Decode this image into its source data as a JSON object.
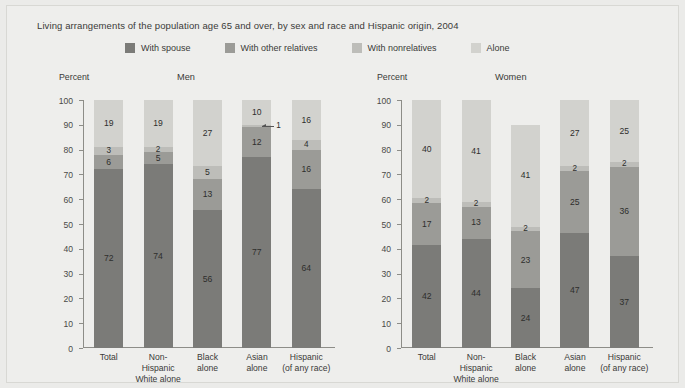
{
  "chart_data": {
    "type": "bar",
    "title": "Living arrangements of the population age 65 and over, by sex and race and Hispanic origin, 2004",
    "subtype": "stacked-bar",
    "ylabel": "Percent",
    "xlabel": "",
    "ylim": [
      0,
      100
    ],
    "ytick_labels": [
      "100",
      "90",
      "80",
      "70",
      "60",
      "50",
      "40",
      "30",
      "20",
      "10",
      "0"
    ],
    "ytick_values": [
      100,
      90,
      80,
      70,
      60,
      50,
      40,
      30,
      20,
      10,
      0
    ],
    "grid": false,
    "legend_position": "top",
    "legend": [
      {
        "label": "With spouse",
        "color": "#7b7b78"
      },
      {
        "label": "With other relatives",
        "color": "#9b9b97"
      },
      {
        "label": "With nonrelatives",
        "color": "#bdbdb9"
      },
      {
        "label": "Alone",
        "color": "#d2d2ce"
      }
    ],
    "series": [
      {
        "name": "With spouse",
        "color": "#7b7b78"
      },
      {
        "name": "With other relatives",
        "color": "#9b9b97"
      },
      {
        "name": "With nonrelatives",
        "color": "#bdbdb9"
      },
      {
        "name": "Alone",
        "color": "#d2d2ce"
      }
    ],
    "categories": [
      "Total",
      "Non-Hispanic White alone",
      "Black alone",
      "Asian alone",
      "Hispanic (of any race)"
    ],
    "panels": [
      {
        "name": "Men",
        "values": {
          "With spouse": [
            72,
            74,
            56,
            77,
            64
          ],
          "With other relatives": [
            6,
            5,
            13,
            12,
            16
          ],
          "With nonrelatives": [
            3,
            2,
            5,
            1,
            4
          ],
          "Alone": [
            19,
            19,
            27,
            10,
            16
          ]
        }
      },
      {
        "name": "Women",
        "values": {
          "With spouse": [
            42,
            44,
            24,
            47,
            37
          ],
          "With other relatives": [
            17,
            13,
            23,
            25,
            36
          ],
          "With nonrelatives": [
            2,
            2,
            2,
            2,
            2
          ],
          "Alone": [
            40,
            41,
            41,
            27,
            25
          ]
        }
      }
    ]
  },
  "panels": [
    {
      "id": "men",
      "heading": "Men",
      "percent_label": "Percent",
      "categories": [
        {
          "line1": "Total",
          "line2": ""
        },
        {
          "line1": "Non-Hispanic",
          "line2": "White alone"
        },
        {
          "line1": "Black",
          "line2": "alone"
        },
        {
          "line1": "Asian",
          "line2": "alone"
        },
        {
          "line1": "Hispanic",
          "line2": "(of any race)"
        }
      ],
      "bars": [
        {
          "segments": [
            {
              "series": "Alone",
              "value": 19,
              "label": "19",
              "callout": false
            },
            {
              "series": "With nonrelatives",
              "value": 3,
              "label": "3",
              "callout": false
            },
            {
              "series": "With other relatives",
              "value": 6,
              "label": "6",
              "callout": false
            },
            {
              "series": "With spouse",
              "value": 72,
              "label": "72",
              "callout": false
            }
          ]
        },
        {
          "segments": [
            {
              "series": "Alone",
              "value": 19,
              "label": "19",
              "callout": false
            },
            {
              "series": "With nonrelatives",
              "value": 2,
              "label": "2",
              "callout": false
            },
            {
              "series": "With other relatives",
              "value": 5,
              "label": "5",
              "callout": false
            },
            {
              "series": "With spouse",
              "value": 74,
              "label": "74",
              "callout": false
            }
          ]
        },
        {
          "segments": [
            {
              "series": "Alone",
              "value": 27,
              "label": "27",
              "callout": false
            },
            {
              "series": "With nonrelatives",
              "value": 5,
              "label": "5",
              "callout": false
            },
            {
              "series": "With other relatives",
              "value": 13,
              "label": "13",
              "callout": false
            },
            {
              "series": "With spouse",
              "value": 56,
              "label": "56",
              "callout": false
            }
          ]
        },
        {
          "segments": [
            {
              "series": "Alone",
              "value": 10,
              "label": "10",
              "callout": false
            },
            {
              "series": "With nonrelatives",
              "value": 1,
              "label": "1",
              "callout": true
            },
            {
              "series": "With other relatives",
              "value": 12,
              "label": "12",
              "callout": false
            },
            {
              "series": "With spouse",
              "value": 77,
              "label": "77",
              "callout": false
            }
          ]
        },
        {
          "segments": [
            {
              "series": "Alone",
              "value": 16,
              "label": "16",
              "callout": false
            },
            {
              "series": "With nonrelatives",
              "value": 4,
              "label": "4",
              "callout": false
            },
            {
              "series": "With other relatives",
              "value": 16,
              "label": "16",
              "callout": false
            },
            {
              "series": "With spouse",
              "value": 64,
              "label": "64",
              "callout": false
            }
          ]
        }
      ]
    },
    {
      "id": "women",
      "heading": "Women",
      "percent_label": "Percent",
      "categories": [
        {
          "line1": "Total",
          "line2": ""
        },
        {
          "line1": "Non-Hispanic",
          "line2": "White alone"
        },
        {
          "line1": "Black",
          "line2": "alone"
        },
        {
          "line1": "Asian",
          "line2": "alone"
        },
        {
          "line1": "Hispanic",
          "line2": "(of any race)"
        }
      ],
      "bars": [
        {
          "segments": [
            {
              "series": "Alone",
              "value": 40,
              "label": "40",
              "callout": false
            },
            {
              "series": "With nonrelatives",
              "value": 2,
              "label": "2",
              "callout": false
            },
            {
              "series": "With other relatives",
              "value": 17,
              "label": "17",
              "callout": false
            },
            {
              "series": "With spouse",
              "value": 42,
              "label": "42",
              "callout": false
            }
          ]
        },
        {
          "segments": [
            {
              "series": "Alone",
              "value": 41,
              "label": "41",
              "callout": false
            },
            {
              "series": "With nonrelatives",
              "value": 2,
              "label": "2",
              "callout": false
            },
            {
              "series": "With other relatives",
              "value": 13,
              "label": "13",
              "callout": false
            },
            {
              "series": "With spouse",
              "value": 44,
              "label": "44",
              "callout": false
            }
          ]
        },
        {
          "segments": [
            {
              "series": "Alone",
              "value": 41,
              "label": "41",
              "callout": false
            },
            {
              "series": "With nonrelatives",
              "value": 2,
              "label": "2",
              "callout": false
            },
            {
              "series": "With other relatives",
              "value": 23,
              "label": "23",
              "callout": false
            },
            {
              "series": "With spouse",
              "value": 24,
              "label": "24",
              "callout": false
            }
          ]
        },
        {
          "segments": [
            {
              "series": "Alone",
              "value": 27,
              "label": "27",
              "callout": false
            },
            {
              "series": "With nonrelatives",
              "value": 2,
              "label": "2",
              "callout": false
            },
            {
              "series": "With other relatives",
              "value": 25,
              "label": "25",
              "callout": false
            },
            {
              "series": "With spouse",
              "value": 47,
              "label": "47",
              "callout": false
            }
          ]
        },
        {
          "segments": [
            {
              "series": "Alone",
              "value": 25,
              "label": "25",
              "callout": false
            },
            {
              "series": "With nonrelatives",
              "value": 2,
              "label": "2",
              "callout": false
            },
            {
              "series": "With other relatives",
              "value": 36,
              "label": "36",
              "callout": false
            },
            {
              "series": "With spouse",
              "value": 37,
              "label": "37",
              "callout": false
            }
          ]
        }
      ]
    }
  ]
}
